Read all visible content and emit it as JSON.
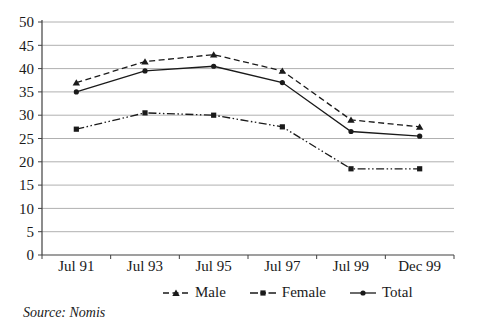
{
  "source_note": "Source: Nomis",
  "colors": {
    "series_line": "#1a1a1a",
    "grid": "#b0b0b0",
    "axis": "#404040",
    "text": "#1a1a1a",
    "background": "#ffffff"
  },
  "chart_data": {
    "type": "line",
    "title": "",
    "xlabel": "",
    "ylabel": "",
    "categories": [
      "Jul 91",
      "Jul 93",
      "Jul 95",
      "Jul 97",
      "Jul 99",
      "Dec 99"
    ],
    "series": [
      {
        "name": "Male",
        "marker": "triangle",
        "line_style": "dashed",
        "values": [
          37,
          41.5,
          43,
          39.5,
          29,
          27.5
        ]
      },
      {
        "name": "Female",
        "marker": "square",
        "line_style": "dash-dot-dot",
        "values": [
          27,
          30.5,
          30,
          27.5,
          18.5,
          18.5
        ]
      },
      {
        "name": "Total",
        "marker": "circle",
        "line_style": "solid",
        "values": [
          35,
          39.5,
          40.5,
          37,
          26.5,
          25.5
        ]
      }
    ],
    "ylim": [
      0,
      50
    ],
    "ytick_step": 5,
    "ytick_labels": [
      "0",
      "5",
      "10",
      "15",
      "20",
      "25",
      "30",
      "35",
      "40",
      "45",
      "50"
    ],
    "grid": true,
    "legend_position": "bottom"
  }
}
